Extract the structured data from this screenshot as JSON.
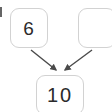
{
  "diagram": {
    "type": "number-bond",
    "background_color": "#ffffff",
    "node_border_color": "#d2d2d2",
    "text_color": "#2b2b2b",
    "arrow_color": "#4a4a4a"
  },
  "nodes": {
    "addend_left": {
      "label": "6",
      "role": "part",
      "filled": "true"
    },
    "addend_right": {
      "label": "",
      "role": "part",
      "filled": "false"
    },
    "sum": {
      "label": "10",
      "role": "whole",
      "filled": "true"
    }
  },
  "arrows": [
    {
      "name": "arrow-left-to-sum",
      "from": "addend_left",
      "to": "sum",
      "direction": "down-right"
    },
    {
      "name": "arrow-right-to-sum",
      "from": "addend_right",
      "to": "sum",
      "direction": "down-left"
    }
  ],
  "edge_fragment": {
    "description": "cropped-glyph-mark"
  }
}
